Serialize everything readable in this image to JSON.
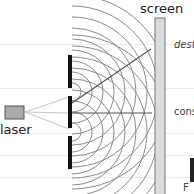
{
  "diagram": {
    "type": "double-slit-experiment",
    "labels": {
      "screen": "screen",
      "laser": "laser",
      "destructive": "dest",
      "constructive": "cons",
      "cut_off": "F"
    },
    "colors": {
      "background": "#ffffff",
      "rule_lines": "#ececec",
      "barrier": "#111111",
      "waves": "#8c8c8c",
      "rays": "#555555",
      "laser_beam": "#c8c8c8",
      "laser_fill": "#a9a9a9",
      "screen_fill": "#dcdcdc"
    },
    "components": [
      "laser",
      "barrier-with-two-slits",
      "wavefronts",
      "screen",
      "ray-to-destructive",
      "ray-to-constructive"
    ]
  }
}
